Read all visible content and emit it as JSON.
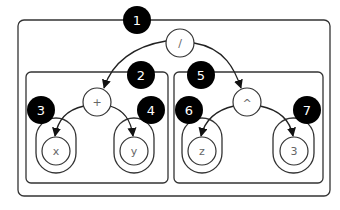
{
  "diagram": {
    "type": "expression-tree-with-nested-scopes",
    "expression": "(x + y) / (z ^ 3)",
    "root": {
      "label": "/",
      "badge": "1"
    },
    "left_subtree": {
      "operator": {
        "label": "+",
        "badge": "2"
      },
      "left_leaf": {
        "label": "x",
        "badge": "3"
      },
      "right_leaf": {
        "label": "y",
        "badge": "4"
      }
    },
    "right_subtree": {
      "operator": {
        "label": "^",
        "badge": "5"
      },
      "left_leaf": {
        "label": "z",
        "badge": "6"
      },
      "right_leaf": {
        "label": "3",
        "badge": "7"
      }
    },
    "colors": {
      "badge_fill": "#000000",
      "badge_text": "#ffffff",
      "stroke": "#333333",
      "node_text": "#666666"
    }
  }
}
